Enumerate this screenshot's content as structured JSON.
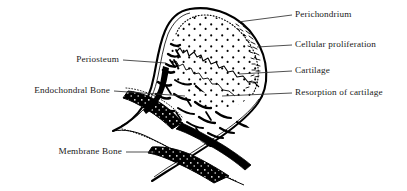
{
  "figure": {
    "type": "anatomical-line-diagram",
    "ink_color": "#000000",
    "text_color": "#1a1a1a",
    "background_color": "#ffffff"
  },
  "labels": {
    "right": [
      {
        "id": "perichondrium",
        "text": "Perichondrium",
        "x": 293,
        "y": 11,
        "leader_from_x": 292,
        "leader_from_y": 15,
        "leader_to_x": 238,
        "leader_to_y": 22
      },
      {
        "id": "cellular_proliferation",
        "text": "Cellular proliferation",
        "x": 293,
        "y": 41,
        "leader_from_x": 292,
        "leader_from_y": 45,
        "leader_to_x": 257,
        "leader_to_y": 47
      },
      {
        "id": "cartilage",
        "text": "Cartilage",
        "x": 293,
        "y": 67,
        "leader_from_x": 292,
        "leader_from_y": 71,
        "leader_to_x": 239,
        "leader_to_y": 74
      },
      {
        "id": "resorption_of_cartilage",
        "text": "Resorption of cartilage",
        "x": 293,
        "y": 89,
        "leader_from_x": 292,
        "leader_from_y": 93,
        "leader_to_x": 222,
        "leader_to_y": 96
      }
    ],
    "left": [
      {
        "id": "periosteum",
        "text": "Periosteum",
        "x": 71,
        "y": 55,
        "leader_from_x": 123,
        "leader_from_y": 60,
        "leader_to_x": 166,
        "leader_to_y": 63
      },
      {
        "id": "endochondral_bone",
        "text": "Endochondral Bone",
        "x": 12,
        "y": 86,
        "leader_from_x": 114,
        "leader_from_y": 91,
        "leader_to_x": 185,
        "leader_to_y": 96
      },
      {
        "id": "membrane_bone",
        "text": "Membrane Bone",
        "x": 41,
        "y": 147,
        "leader_from_x": 126,
        "leader_from_y": 152,
        "leader_to_x": 155,
        "leader_to_y": 152
      }
    ]
  }
}
